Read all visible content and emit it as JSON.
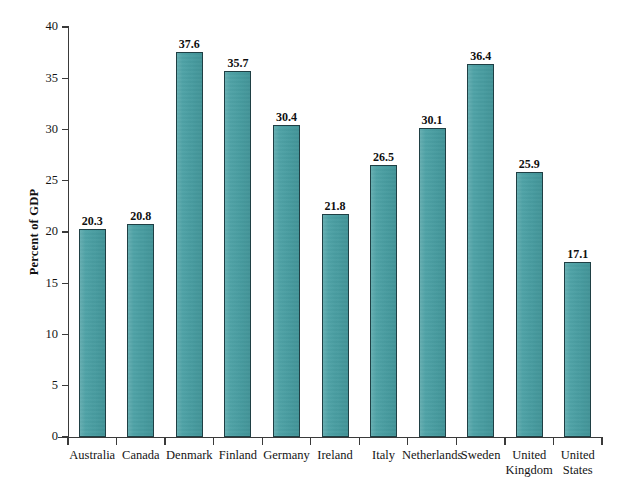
{
  "chart_data": {
    "type": "bar",
    "title": "",
    "subtitle": "",
    "xlabel": "",
    "ylabel": "Percent of GDP",
    "ylim": [
      0,
      40
    ],
    "ytick_step": 5,
    "yticks": [
      "40",
      "35",
      "30",
      "25",
      "20",
      "15",
      "10",
      "5",
      "0"
    ],
    "ytick_values": [
      40,
      35,
      30,
      25,
      20,
      15,
      10,
      5,
      0
    ],
    "grid": false,
    "legend": null,
    "bar_color": "#479fa3",
    "bar_edge_color": "#1f3f44",
    "axis_color": "#3a3a3a",
    "categories": [
      "Australia",
      "Canada",
      "Denmark",
      "Finland",
      "Germany",
      "Ireland",
      "Italy",
      "Netherlands",
      "Sweden",
      "United Kingdom",
      "United States"
    ],
    "category_lines": [
      [
        "Australia"
      ],
      [
        "Canada"
      ],
      [
        "Denmark"
      ],
      [
        "Finland"
      ],
      [
        "Germany"
      ],
      [
        "Ireland"
      ],
      [
        "Italy"
      ],
      [
        "Netherlands"
      ],
      [
        "Sweden"
      ],
      [
        "United",
        "Kingdom"
      ],
      [
        "United",
        "States"
      ]
    ],
    "values": [
      20.3,
      20.8,
      37.6,
      35.7,
      30.4,
      21.8,
      26.5,
      30.1,
      36.4,
      25.9,
      17.1
    ],
    "value_labels": [
      "20.3",
      "20.8",
      "37.6",
      "35.7",
      "30.4",
      "21.8",
      "26.5",
      "30.1",
      "36.4",
      "25.9",
      "17.1"
    ]
  }
}
